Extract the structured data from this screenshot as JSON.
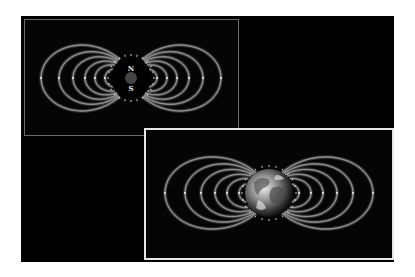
{
  "figure": {
    "title": "",
    "top_panel": {
      "description": "Magnetic dipole field lines around a bar-magnet sphere",
      "north_label": "N",
      "south_label": "S",
      "core_color": "#000000"
    },
    "bottom_panel": {
      "description": "Earth's magnetic field lines around the globe"
    },
    "colors": {
      "background": "#000000",
      "field_line": "#bfbfbf",
      "frame_top": "#6a6a6a",
      "frame_bottom": "#e6e6e6",
      "page": "#ffffff"
    },
    "field_line_count": 6
  }
}
